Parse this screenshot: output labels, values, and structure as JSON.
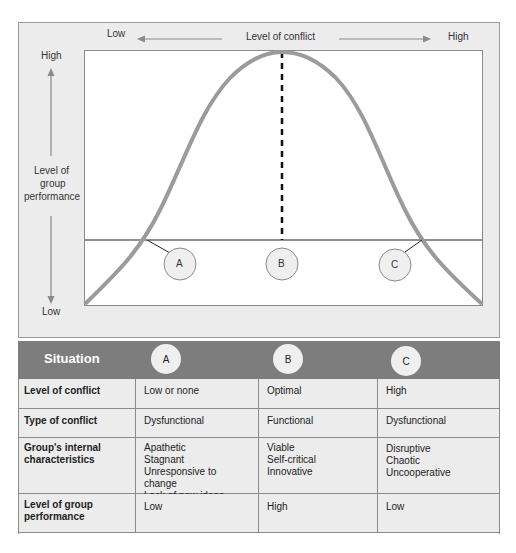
{
  "figure": {
    "x_axis": {
      "title": "Level of conflict",
      "low": "Low",
      "high": "High"
    },
    "y_axis": {
      "title_lines": [
        "Level of",
        "group",
        "performance"
      ],
      "high": "High",
      "low": "Low"
    },
    "points": [
      {
        "label": "A",
        "position": "left intersection"
      },
      {
        "label": "B",
        "position": "peak (optimal)"
      },
      {
        "label": "C",
        "position": "right intersection"
      }
    ]
  },
  "table": {
    "header": {
      "title": "Situation",
      "columns": [
        "A",
        "B",
        "C"
      ]
    },
    "rows": [
      {
        "label": "Level of conflict",
        "values": [
          "Low or none",
          "Optimal",
          "High"
        ]
      },
      {
        "label": "Type of conflict",
        "values": [
          "Dysfunctional",
          "Functional",
          "Dysfunctional"
        ]
      },
      {
        "label": "Group's internal characteristics",
        "values": [
          [
            "Apathetic",
            "Stagnant",
            "Unresponsive to change",
            "Lack of new ideas"
          ],
          [
            "Viable",
            "Self-critical",
            "Innovative"
          ],
          [
            "Disruptive",
            "Chaotic",
            "Uncooperative"
          ]
        ]
      },
      {
        "label": "Level of group performance",
        "values": [
          "Low",
          "High",
          "Low"
        ]
      }
    ]
  },
  "colors": {
    "frame_bg": "#ececec",
    "curve": "#9b9b9b",
    "header_band": "#7d7d7d",
    "circle_fill": "#efefef"
  }
}
